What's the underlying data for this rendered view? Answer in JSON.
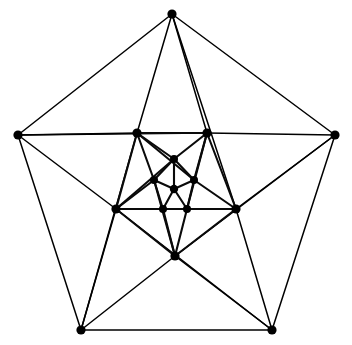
{
  "figure": {
    "kind": "graph-drawing",
    "background_color": "#ffffff",
    "edge_color": "#000000",
    "vertex_color": "#000000",
    "canvas": {
      "width": 352,
      "height": 345
    },
    "vertex_radius": 4.6,
    "layers": [
      {
        "name": "outer-pentagon",
        "count": 5
      },
      {
        "name": "middle-pentagon",
        "count": 5
      },
      {
        "name": "inner-pentagon",
        "count": 5
      },
      {
        "name": "center",
        "count": 1
      }
    ],
    "vertex_count": 16,
    "edge_count": 50
  },
  "chart_data": {
    "type": "graph",
    "xlabel": "",
    "ylabel": "",
    "grid": false,
    "legend": "none",
    "xlim": [
      0,
      352
    ],
    "ylim": [
      0,
      345
    ],
    "vertices": [
      {
        "id": "o0",
        "label": "",
        "layer": "outer",
        "x": 172,
        "y": 14
      },
      {
        "id": "o1",
        "label": "",
        "layer": "outer",
        "x": 335,
        "y": 135
      },
      {
        "id": "o2",
        "label": "",
        "layer": "outer",
        "x": 272,
        "y": 330
      },
      {
        "id": "o3",
        "label": "",
        "layer": "outer",
        "x": 81,
        "y": 330
      },
      {
        "id": "o4",
        "label": "",
        "layer": "outer",
        "x": 18,
        "y": 135
      },
      {
        "id": "m0",
        "label": "",
        "layer": "middle",
        "x": 207,
        "y": 133
      },
      {
        "id": "m1",
        "label": "",
        "layer": "middle",
        "x": 236,
        "y": 209
      },
      {
        "id": "m2",
        "label": "",
        "layer": "middle",
        "x": 175,
        "y": 256
      },
      {
        "id": "m3",
        "label": "",
        "layer": "middle",
        "x": 116,
        "y": 209
      },
      {
        "id": "m4",
        "label": "",
        "layer": "middle",
        "x": 137,
        "y": 133
      },
      {
        "id": "i0",
        "label": "",
        "layer": "inner",
        "x": 174,
        "y": 159
      },
      {
        "id": "i1",
        "label": "",
        "layer": "inner",
        "x": 194,
        "y": 180
      },
      {
        "id": "i2",
        "label": "",
        "layer": "inner",
        "x": 187,
        "y": 209
      },
      {
        "id": "i3",
        "label": "",
        "layer": "inner",
        "x": 163,
        "y": 209
      },
      {
        "id": "i4",
        "label": "",
        "layer": "inner",
        "x": 154,
        "y": 180
      },
      {
        "id": "c0",
        "label": "",
        "layer": "center",
        "x": 174,
        "y": 189
      }
    ],
    "edges": [
      [
        "o0",
        "o1"
      ],
      [
        "o1",
        "o2"
      ],
      [
        "o2",
        "o3"
      ],
      [
        "o3",
        "o4"
      ],
      [
        "o4",
        "o0"
      ],
      [
        "o4",
        "m0"
      ],
      [
        "o0",
        "m1"
      ],
      [
        "o1",
        "m2"
      ],
      [
        "o2",
        "m3"
      ],
      [
        "o3",
        "m4"
      ],
      [
        "o4",
        "m4"
      ],
      [
        "o0",
        "m4"
      ],
      [
        "o0",
        "m0"
      ],
      [
        "o1",
        "m0"
      ],
      [
        "o1",
        "m1"
      ],
      [
        "o2",
        "m1"
      ],
      [
        "o2",
        "m2"
      ],
      [
        "o3",
        "m2"
      ],
      [
        "o3",
        "m3"
      ],
      [
        "o4",
        "m3"
      ],
      [
        "m0",
        "m1"
      ],
      [
        "m1",
        "m2"
      ],
      [
        "m2",
        "m3"
      ],
      [
        "m3",
        "m4"
      ],
      [
        "m4",
        "m0"
      ],
      [
        "m0",
        "i0"
      ],
      [
        "m1",
        "i1"
      ],
      [
        "m2",
        "i2"
      ],
      [
        "m3",
        "i3"
      ],
      [
        "m4",
        "i4"
      ],
      [
        "m4",
        "i0"
      ],
      [
        "m0",
        "i1"
      ],
      [
        "m1",
        "i2"
      ],
      [
        "m2",
        "i3"
      ],
      [
        "m3",
        "i4"
      ],
      [
        "m0",
        "i2"
      ],
      [
        "m1",
        "i3"
      ],
      [
        "m2",
        "i4"
      ],
      [
        "m3",
        "i0"
      ],
      [
        "m4",
        "i1"
      ],
      [
        "i0",
        "i1"
      ],
      [
        "i1",
        "i2"
      ],
      [
        "i2",
        "i3"
      ],
      [
        "i3",
        "i4"
      ],
      [
        "i4",
        "i0"
      ],
      [
        "c0",
        "i0"
      ],
      [
        "c0",
        "i1"
      ],
      [
        "c0",
        "i2"
      ],
      [
        "c0",
        "i3"
      ],
      [
        "c0",
        "i4"
      ]
    ]
  }
}
